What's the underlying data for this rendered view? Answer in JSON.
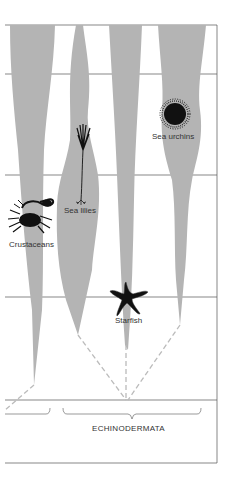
{
  "diagram": {
    "colors": {
      "spindle": "#b4b4b4",
      "line": "#555555",
      "dash": "#bbbbbb",
      "icon": "#111111",
      "text": "#333333"
    },
    "lineages": [
      {
        "id": "crustaceans",
        "label": "Crustaceans",
        "icon": "crab-icon"
      },
      {
        "id": "sea-lilies",
        "label": "Sea lilies",
        "icon": "sea-lily-icon"
      },
      {
        "id": "starfish",
        "label": "Starfish",
        "icon": "starfish-icon"
      },
      {
        "id": "sea-urchins",
        "label": "Sea urchins",
        "icon": "sea-urchin-icon"
      }
    ],
    "group_label": "ECHINODERMATA"
  }
}
